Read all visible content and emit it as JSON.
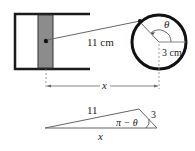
{
  "piston_diagram": {
    "rod_length_label": "11 cm",
    "radius_label": "3 cm",
    "angle_label": "θ",
    "distance_label": "x"
  },
  "triangle_diagram": {
    "side_long_label": "11",
    "side_short_label": "3",
    "angle_label": "π − θ",
    "base_label": "x"
  },
  "colors": {
    "stroke": "#1a1a1a",
    "piston_fill": "#8c8c8c",
    "thin_line": "#555555",
    "background": "#ffffff"
  }
}
